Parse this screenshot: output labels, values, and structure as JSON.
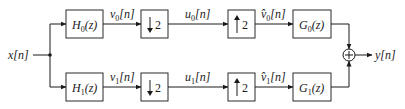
{
  "colors": {
    "line": "#1a1a1a",
    "box_fill": "#ffffff",
    "background": "#ffffff"
  },
  "input": {
    "label": "x[n]"
  },
  "output": {
    "label": "y[n]"
  },
  "channels": [
    {
      "analysis_filter": {
        "name": "H",
        "sub": "0",
        "arg": "(z)"
      },
      "signal_v": {
        "name": "v",
        "sub": "0",
        "arg": "[n]"
      },
      "downsampler": {
        "arrow": "down",
        "factor": "2"
      },
      "signal_u": {
        "name": "u",
        "sub": "0",
        "arg": "[n]"
      },
      "upsampler": {
        "arrow": "up",
        "factor": "2"
      },
      "signal_vhat": {
        "name": "v̂",
        "sub": "0",
        "arg": "[n]"
      },
      "synthesis_filter": {
        "name": "G",
        "sub": "0",
        "arg": "(z)"
      }
    },
    {
      "analysis_filter": {
        "name": "H",
        "sub": "1",
        "arg": "(z)"
      },
      "signal_v": {
        "name": "v",
        "sub": "1",
        "arg": "[n]"
      },
      "downsampler": {
        "arrow": "down",
        "factor": "2"
      },
      "signal_u": {
        "name": "u",
        "sub": "1",
        "arg": "[n]"
      },
      "upsampler": {
        "arrow": "up",
        "factor": "2"
      },
      "signal_vhat": {
        "name": "v̂",
        "sub": "1",
        "arg": "[n]"
      },
      "synthesis_filter": {
        "name": "G",
        "sub": "1",
        "arg": "(z)"
      }
    }
  ],
  "summer": {
    "symbol": "+"
  }
}
